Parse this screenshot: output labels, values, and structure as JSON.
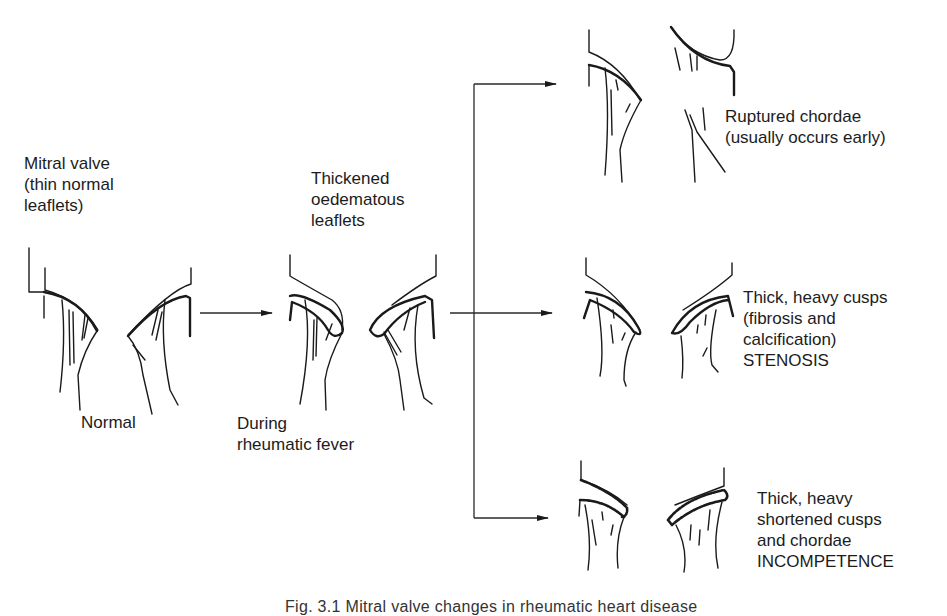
{
  "diagram": {
    "stages": [
      {
        "id": "normal",
        "top_label": [
          "Mitral valve",
          "(thin normal",
          "leaflets)"
        ],
        "bottom_label": [
          "Normal"
        ]
      },
      {
        "id": "rheumatic",
        "top_label": [
          "Thickened",
          "oedematous",
          "leaflets"
        ],
        "bottom_label": [
          "During",
          "rheumatic fever"
        ]
      }
    ],
    "outcomes": [
      {
        "id": "ruptured",
        "label": [
          "Ruptured chordae",
          "(usually occurs early)"
        ]
      },
      {
        "id": "stenosis",
        "label": [
          "Thick, heavy cusps",
          "(fibrosis and",
          "calcification)",
          "STENOSIS"
        ]
      },
      {
        "id": "incompetence",
        "label": [
          "Thick, heavy",
          "shortened cusps",
          "and chordae",
          "INCOMPETENCE"
        ]
      }
    ],
    "caption": "Fig. 3.1   Mitral valve changes in rheumatic heart disease",
    "colors": {
      "line": "#1a1a1a",
      "background": "#ffffff"
    }
  }
}
